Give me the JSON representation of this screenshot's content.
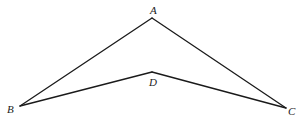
{
  "diagram": {
    "type": "geometry-figure",
    "points": [
      {
        "id": "A",
        "label": "A",
        "x": 152,
        "y": 18,
        "label_x": 150,
        "label_y": 14
      },
      {
        "id": "B",
        "label": "B",
        "x": 20,
        "y": 106,
        "label_x": 7,
        "label_y": 113
      },
      {
        "id": "C",
        "label": "C",
        "x": 286,
        "y": 108,
        "label_x": 288,
        "label_y": 115
      },
      {
        "id": "D",
        "label": "D",
        "x": 152,
        "y": 72,
        "label_x": 149,
        "label_y": 86
      }
    ],
    "segments": [
      {
        "from": "A",
        "to": "B"
      },
      {
        "from": "A",
        "to": "C"
      },
      {
        "from": "B",
        "to": "D"
      },
      {
        "from": "D",
        "to": "C"
      }
    ],
    "line_color": "#1a1a1a",
    "background": "#ffffff"
  }
}
